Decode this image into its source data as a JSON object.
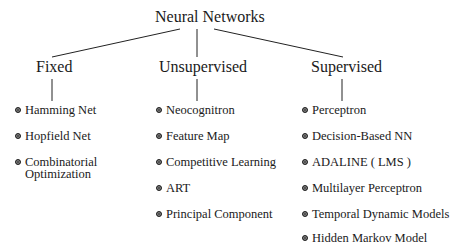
{
  "diagram": {
    "type": "tree",
    "root": {
      "label": "Neural Networks"
    },
    "categories": [
      {
        "label": "Fixed",
        "items": [
          {
            "label": "Hamming Net"
          },
          {
            "label": "Hopfield Net"
          },
          {
            "label": "Combinatorial",
            "label2": "Optimization"
          }
        ]
      },
      {
        "label": "Unsupervised",
        "items": [
          {
            "label": "Neocognitron"
          },
          {
            "label": "Feature Map"
          },
          {
            "label": "Competitive Learning"
          },
          {
            "label": "ART"
          },
          {
            "label": "Principal Component"
          }
        ]
      },
      {
        "label": "Supervised",
        "items": [
          {
            "label": "Perceptron"
          },
          {
            "label": "Decision-Based NN"
          },
          {
            "label": "ADALINE ( LMS )"
          },
          {
            "label": "Multilayer Perceptron"
          },
          {
            "label": "Temporal Dynamic Models"
          },
          {
            "label": "Hidden Markov Model"
          }
        ]
      }
    ],
    "bullet_color": "#444444",
    "line_color": "#222222"
  }
}
